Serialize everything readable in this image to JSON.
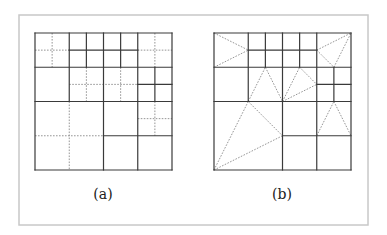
{
  "figure": {
    "frame": {
      "x": 19,
      "y": 15,
      "w": 349,
      "h": 210
    },
    "panels": [
      {
        "id": "a",
        "label": "(a)",
        "origin": [
          35,
          33
        ],
        "size": 137,
        "units": 8,
        "label_pos": [
          103,
          199
        ],
        "solid": [
          [
            0,
            0,
            8,
            0
          ],
          [
            0,
            8,
            8,
            8
          ],
          [
            0,
            0,
            0,
            8
          ],
          [
            8,
            0,
            8,
            8
          ],
          [
            0,
            2,
            8,
            2
          ],
          [
            0,
            4,
            8,
            4
          ],
          [
            2,
            0,
            2,
            4
          ],
          [
            4,
            0,
            4,
            8
          ],
          [
            6,
            0,
            6,
            8
          ],
          [
            3,
            0,
            3,
            2
          ],
          [
            5,
            0,
            5,
            2
          ],
          [
            2,
            1,
            6,
            1
          ],
          [
            7,
            2,
            7,
            4
          ],
          [
            6,
            3,
            8,
            3
          ],
          [
            4,
            6,
            8,
            6
          ]
        ],
        "dashed": [
          [
            1,
            0,
            1,
            2
          ],
          [
            0,
            1,
            2,
            1
          ],
          [
            7,
            0,
            7,
            2
          ],
          [
            6,
            1,
            8,
            1
          ],
          [
            3,
            2,
            3,
            4
          ],
          [
            5,
            2,
            5,
            4
          ],
          [
            2,
            3,
            6,
            3
          ],
          [
            2,
            4,
            2,
            8
          ],
          [
            0,
            6,
            4,
            6
          ],
          [
            7,
            4,
            7,
            6
          ],
          [
            6,
            5,
            8,
            5
          ]
        ]
      },
      {
        "id": "b",
        "label": "(b)",
        "origin": [
          214,
          33
        ],
        "size": 137,
        "units": 8,
        "label_pos": [
          282,
          199
        ],
        "solid": [
          [
            0,
            0,
            8,
            0
          ],
          [
            0,
            8,
            8,
            8
          ],
          [
            0,
            0,
            0,
            8
          ],
          [
            8,
            0,
            8,
            8
          ],
          [
            0,
            2,
            8,
            2
          ],
          [
            0,
            4,
            8,
            4
          ],
          [
            2,
            0,
            2,
            4
          ],
          [
            4,
            0,
            4,
            8
          ],
          [
            6,
            0,
            6,
            8
          ],
          [
            3,
            0,
            3,
            2
          ],
          [
            5,
            0,
            5,
            2
          ],
          [
            2,
            1,
            6,
            1
          ],
          [
            7,
            2,
            7,
            4
          ],
          [
            6,
            3,
            8,
            3
          ],
          [
            4,
            6,
            8,
            6
          ]
        ],
        "dashed": [
          [
            0,
            0,
            2,
            1
          ],
          [
            0,
            2,
            2,
            1
          ],
          [
            6,
            1,
            8,
            0
          ],
          [
            6,
            1,
            7,
            2
          ],
          [
            7,
            2,
            8,
            0
          ],
          [
            2,
            4,
            3,
            2
          ],
          [
            3,
            2,
            4,
            4
          ],
          [
            4,
            4,
            5,
            2
          ],
          [
            5,
            2,
            6,
            3
          ],
          [
            4,
            4,
            6,
            3
          ],
          [
            0,
            8,
            2,
            4
          ],
          [
            2,
            4,
            4,
            6
          ],
          [
            0,
            8,
            4,
            6
          ],
          [
            6,
            6,
            7,
            4
          ],
          [
            7,
            4,
            8,
            6
          ]
        ]
      }
    ]
  }
}
